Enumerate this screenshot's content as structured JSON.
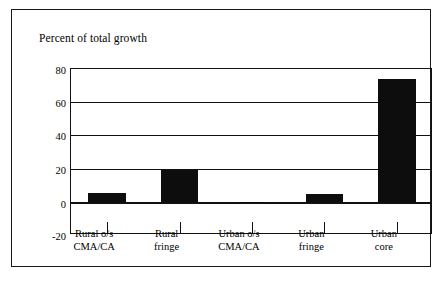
{
  "chart_data": {
    "type": "bar",
    "title": "Percent of total growth",
    "xlabel": "",
    "ylabel": "",
    "categories": [
      "Rural o/s\nCMA/CA",
      "Rural\nfringe",
      "Urban o/s\nCMA/CA",
      "Urban\nfringe",
      "Urban\ncore"
    ],
    "values": [
      5.5,
      19,
      -0.5,
      4.5,
      74
    ],
    "ylim": [
      -20,
      80
    ],
    "yticks": [
      80,
      60,
      40,
      20,
      0,
      -20
    ],
    "ytick_labels": [
      "80",
      "60",
      "40",
      "20",
      "0",
      "-20"
    ],
    "grid": true,
    "legend": "none",
    "bar_color": "#0d0d0d",
    "axis_color": "#111111",
    "background": "#ffffff"
  },
  "figure": {
    "frame_border_color": "#1a1a1a"
  }
}
